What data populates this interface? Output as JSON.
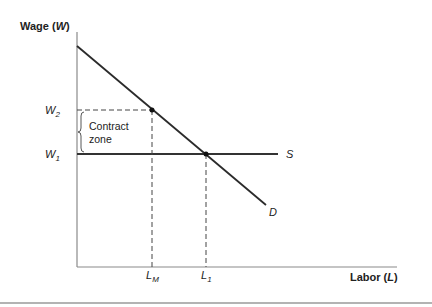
{
  "diagram": {
    "y_axis_title": "Wage (",
    "y_axis_var": "W",
    "y_axis_close": ")",
    "x_axis_title": "Labor (",
    "x_axis_var": "L",
    "x_axis_close": ")",
    "wage_levels": [
      {
        "label": "W",
        "sub": "2",
        "name": "W2"
      },
      {
        "label": "W",
        "sub": "1",
        "name": "W1"
      }
    ],
    "labor_levels": [
      {
        "label": "L",
        "sub": "M",
        "name": "LM"
      },
      {
        "label": "L",
        "sub": "1",
        "name": "L1"
      }
    ],
    "curves": {
      "supply": "S",
      "demand": "D"
    },
    "annotation": {
      "line1": "Contract",
      "line2": "zone"
    }
  }
}
